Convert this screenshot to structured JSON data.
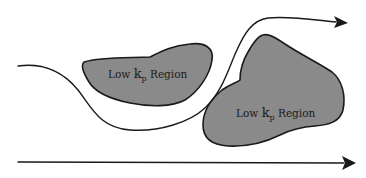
{
  "diagram": {
    "regions": [
      {
        "id": "region-1",
        "label_prefix": "Low ",
        "label_symbol": "k",
        "label_subscript": "p",
        "label_suffix": " Region"
      },
      {
        "id": "region-2",
        "label_prefix": "Low ",
        "label_symbol": "k",
        "label_subscript": "p",
        "label_suffix": " Region"
      }
    ],
    "arrows": [
      {
        "id": "tortuous-flow-path",
        "type": "curved"
      },
      {
        "id": "straight-flow-path",
        "type": "straight"
      }
    ],
    "colors": {
      "region_fill": "#8a8a8a",
      "stroke": "#1a1a1a",
      "background": "#ffffff"
    }
  }
}
